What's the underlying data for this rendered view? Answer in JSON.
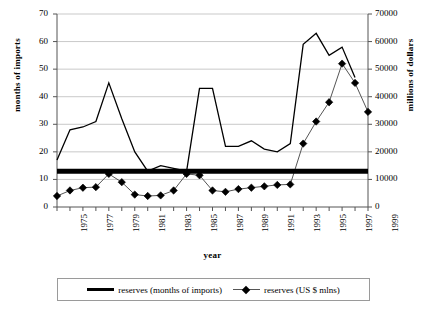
{
  "chart_data": {
    "type": "line",
    "title": "",
    "xlabel": "year",
    "ylabel": "months of imports",
    "y2label": "millions of dollars",
    "x": [
      1975,
      1976,
      1977,
      1978,
      1979,
      1980,
      1981,
      1982,
      1983,
      1984,
      1985,
      1986,
      1987,
      1988,
      1989,
      1990,
      1991,
      1992,
      1993,
      1994,
      1995,
      1996,
      1997,
      1998,
      1999
    ],
    "xlim": [
      1975,
      1999
    ],
    "ylim": [
      0,
      70
    ],
    "y2lim": [
      0,
      70000
    ],
    "yticks": [
      0,
      10,
      20,
      30,
      40,
      50,
      60,
      70
    ],
    "y2ticks": [
      0,
      10000,
      20000,
      30000,
      40000,
      50000,
      60000,
      70000
    ],
    "xticks": [
      1975,
      1977,
      1979,
      1981,
      1983,
      1985,
      1987,
      1989,
      1991,
      1993,
      1995,
      1997,
      1999
    ],
    "grid": true,
    "legend_position": "bottom",
    "series": [
      {
        "name": "reserves (months of imports)",
        "axis": "left",
        "style": "thin-line",
        "color": "#000000",
        "values": [
          17,
          28,
          29,
          31,
          45,
          32,
          20,
          13,
          15,
          14,
          13,
          43,
          43,
          22,
          22,
          24,
          21,
          20,
          23,
          59,
          63,
          55,
          58,
          47,
          null
        ]
      },
      {
        "name": "reserves (US $ mlns)",
        "axis": "right",
        "style": "marker-line",
        "color": "#555555",
        "marker": "diamond",
        "values": [
          4000,
          6000,
          7000,
          7200,
          12000,
          9000,
          4500,
          4000,
          4200,
          6000,
          12000,
          11500,
          6000,
          5500,
          6500,
          7000,
          7500,
          8000,
          8200,
          23000,
          31000,
          38000,
          52000,
          45000,
          34500
        ]
      },
      {
        "name": "reserves threshold band",
        "axis": "left",
        "style": "thick-line",
        "color": "#000000",
        "constant": 13
      }
    ]
  }
}
